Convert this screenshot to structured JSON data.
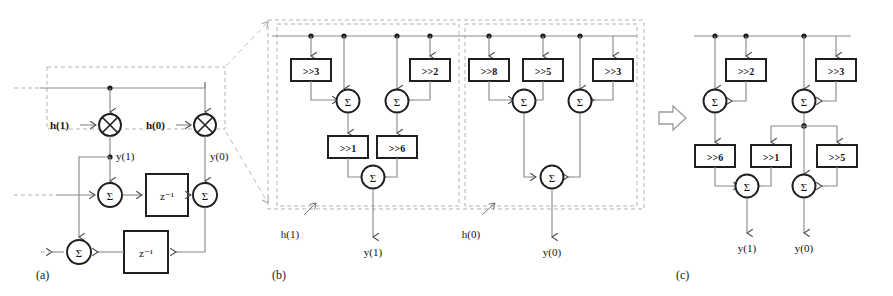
{
  "figure": {
    "title": "",
    "background": "#ffffff",
    "wire_color": "#808080",
    "box_color": "#1a1a1a",
    "dash_color": "#b0b0b0"
  },
  "panels": [
    {
      "id": "a",
      "caption": "(a)",
      "description": "Transposed direct form FIR block with coefficient multipliers",
      "coefficients": [
        "h(1)",
        "h(0)"
      ],
      "multiplier_glyph": "⊗",
      "sum_glyph": "Σ",
      "signals": [
        "y(1)",
        "y(0)"
      ],
      "delays": [
        "z",
        "z"
      ],
      "delay_exponent": "-1",
      "delay_label": "z⁻¹",
      "sum_count": 3,
      "multiplier_count": 2
    },
    {
      "id": "b",
      "caption": "(b)",
      "description": "Shift-add expansion of each coefficient multiplier",
      "groups": [
        {
          "name": "h(1)",
          "output": "y(1)",
          "shifts_row1": [
            ">>3",
            ">>2"
          ],
          "shifts_row2": [
            ">>1",
            ">>6"
          ],
          "adders_row1": 2,
          "adders_row2": 1
        },
        {
          "name": "h(0)",
          "output": "y(0)",
          "shifts_row1": [
            ">>8",
            ">>5",
            ">>3"
          ],
          "shifts_row2": [],
          "adders_row1": 2,
          "adders_row2": 1
        }
      ],
      "sum_glyph": "Σ"
    },
    {
      "id": "c",
      "caption": "(c)",
      "description": "Optimized shared shift-add network",
      "shifts_row1": [
        ">>2",
        ">>3"
      ],
      "shifts_row2": [
        ">>6",
        ">>1",
        ">>5"
      ],
      "outputs": [
        "y(1)",
        "y(0)"
      ],
      "sum_glyph": "Σ",
      "adders_row1": 2,
      "adders_row2": 2
    }
  ],
  "transform_arrow": {
    "glyph": "⇨",
    "name": "rightwards-white-arrow"
  },
  "expansion_leader": {
    "style": "dashed",
    "from_panel": "a",
    "to_panel": "b"
  }
}
